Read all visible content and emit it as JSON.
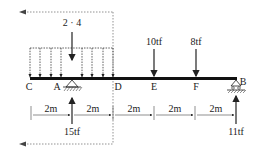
{
  "diagram": {
    "type": "beam-loading",
    "distributed_load": {
      "label": "2 · 4",
      "from": "C",
      "to": "D"
    },
    "points": [
      {
        "name": "C",
        "label": "C"
      },
      {
        "name": "A",
        "label": "A"
      },
      {
        "name": "D",
        "label": "D"
      },
      {
        "name": "E",
        "label": "E"
      },
      {
        "name": "F",
        "label": "F"
      },
      {
        "name": "B",
        "label": "B"
      }
    ],
    "point_loads": [
      {
        "at": "E",
        "label": "10tf",
        "direction": "down"
      },
      {
        "at": "F",
        "label": "8tf",
        "direction": "down"
      }
    ],
    "reactions": [
      {
        "at": "A",
        "label": "15tf",
        "direction": "up",
        "support": "pin"
      },
      {
        "at": "B",
        "label": "11tf",
        "direction": "up",
        "support": "roller"
      }
    ],
    "spans": [
      "2m",
      "2m",
      "2m",
      "2m",
      "2m"
    ]
  }
}
